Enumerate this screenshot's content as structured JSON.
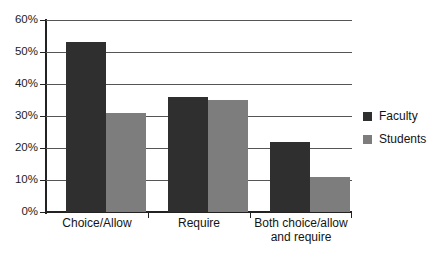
{
  "chart_data": {
    "type": "bar",
    "title": "",
    "subtitle": "",
    "xlabel": "",
    "ylabel": "",
    "categories": [
      "Choice/Allow",
      "Require",
      "Both choice/allow\nand require"
    ],
    "series": [
      {
        "name": "Faculty",
        "color": "#2f2f2f",
        "values": [
          53,
          36,
          22
        ]
      },
      {
        "name": "Students",
        "color": "#7d7d7d",
        "values": [
          31,
          35,
          11
        ]
      }
    ],
    "ylim": [
      0,
      60
    ],
    "ytick_values": [
      0,
      10,
      20,
      30,
      40,
      50,
      60
    ],
    "ytick_labels": [
      "0%",
      "10%",
      "20%",
      "30%",
      "40%",
      "50%",
      "60%"
    ],
    "grid": true,
    "grid_axis": "y",
    "legend_position": "right",
    "axis_color": "#222222",
    "grid_color": "#555555",
    "background": "#ffffff"
  },
  "legend": {
    "entries": [
      {
        "label": "Faculty",
        "swatch_name": "legend-swatch-faculty"
      },
      {
        "label": "Students",
        "swatch_name": "legend-swatch-students"
      }
    ]
  },
  "axes": {
    "y_labels": {
      "t60": "60%",
      "t50": "50%",
      "t40": "40%",
      "t30": "30%",
      "t20": "20%",
      "t10": "10%",
      "t0": "0%"
    },
    "x_labels": {
      "c0": "Choice/Allow",
      "c1": "Require",
      "c2": "Both choice/allow\nand require"
    }
  }
}
